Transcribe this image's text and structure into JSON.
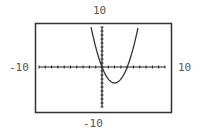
{
  "chart_data": {
    "type": "line",
    "title": "",
    "function": "y = x^2 - 4x",
    "xlabel": "",
    "ylabel": "",
    "xlim": [
      -10,
      10
    ],
    "ylim": [
      -10,
      10
    ],
    "xscl": 1,
    "yscl": 1,
    "grid": false,
    "window_labels": {
      "ymax": "10",
      "ymin": "-10",
      "xmin": "-10",
      "xmax": "10"
    },
    "series": [
      {
        "name": "curve",
        "x": [
          -1.74,
          -1,
          0,
          1,
          2,
          3,
          4,
          5,
          5.74
        ],
        "y": [
          10,
          5,
          0,
          -3,
          -4,
          -3,
          0,
          5,
          10
        ]
      }
    ]
  },
  "colors": {
    "axis": "#222222",
    "curve": "#333333",
    "frame": "#333333",
    "label": "#555555"
  }
}
